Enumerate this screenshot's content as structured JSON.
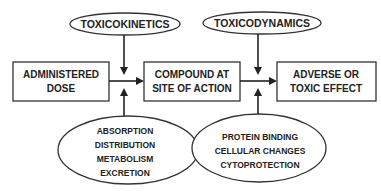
{
  "diagram": {
    "top_ellipses": {
      "left": {
        "label": "TOXICOKINETICS"
      },
      "right": {
        "label": "TOXICODYNAMICS"
      }
    },
    "boxes": [
      {
        "line1": "ADMINISTERED",
        "line2": "DOSE"
      },
      {
        "line1": "COMPOUND AT",
        "line2": "SITE OF ACTION"
      },
      {
        "line1": "ADVERSE OR",
        "line2": "TOXIC EFFECT"
      }
    ],
    "bottom_ellipses": {
      "left": {
        "items": [
          "ABSORPTION",
          "DISTRIBUTION",
          "METABOLISM",
          "EXCRETION"
        ]
      },
      "right": {
        "items": [
          "PROTEIN BINDING",
          "CELLULAR CHANGES",
          "CYTOPROTECTION"
        ]
      }
    },
    "colors": {
      "stroke": "#333333",
      "text": "#222222",
      "background": "#ffffff"
    }
  }
}
